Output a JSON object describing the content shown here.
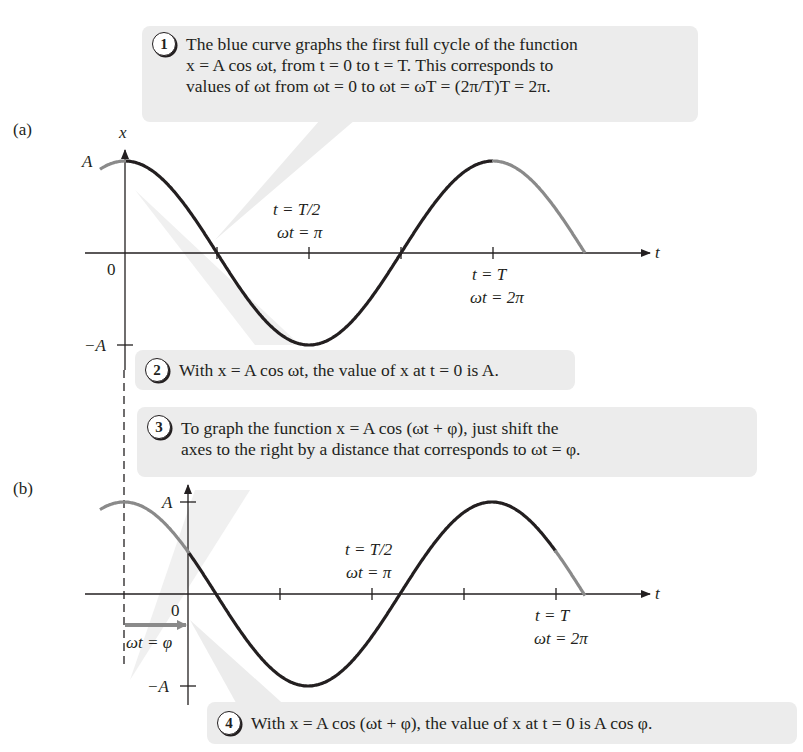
{
  "figure": {
    "panel_a_label": "(a)",
    "panel_b_label": "(b)",
    "axis_x_label": "x",
    "axis_t_label": "t",
    "zero_label": "0",
    "amp_pos_label": "A",
    "amp_neg_label": "−A",
    "half_period_line1": "t = T/2",
    "half_period_line2": "ωt = π",
    "period_line1": "t = T",
    "period_line2": "ωt = 2π",
    "phase_label": "ωt = φ"
  },
  "callouts": [
    {
      "number": "1",
      "lines": [
        "The blue curve graphs the first full cycle of the function",
        "x = A cos ωt, from t = 0 to t = T. This corresponds to",
        "values of ωt from ωt = 0 to ωt = ωT = (2π/T)T = 2π."
      ]
    },
    {
      "number": "2",
      "lines": [
        "With x = A cos ωt, the value of x at t = 0 is A."
      ]
    },
    {
      "number": "3",
      "lines": [
        "To graph the function x = A cos (ωt + φ), just shift the",
        "axes to the right by a distance that corresponds to ωt = φ."
      ]
    },
    {
      "number": "4",
      "lines": [
        "With x = A cos (ωt + φ), the value of x at t = 0 is A cos φ."
      ]
    }
  ],
  "colors": {
    "curve_main": "#231f20",
    "curve_extension": "#8a8a8a",
    "callout_bg": "#ececec",
    "phase_arrow": "#8a8a8a"
  },
  "chart_data": [
    {
      "type": "line",
      "title": "(a) x = A cos ωt",
      "xlabel": "t",
      "ylabel": "x",
      "x_ticks": [
        "T/4",
        "T/2",
        "3T/4",
        "T"
      ],
      "y_ticks": [
        "A",
        "0",
        "−A"
      ],
      "series": [
        {
          "name": "x = A cos ωt",
          "x_phase": [
            0,
            0.5,
            1,
            1.5,
            2
          ],
          "values": [
            1,
            0,
            -1,
            0,
            1
          ]
        }
      ],
      "grid": false
    },
    {
      "type": "line",
      "title": "(b) x = A cos (ωt + φ)",
      "xlabel": "t",
      "ylabel": "x",
      "y_ticks": [
        "A",
        "0",
        "−A"
      ],
      "series": [
        {
          "name": "x = A cos (ωt + φ)",
          "phi_fraction_of_period": 0.17,
          "values_at_t0": "A cos φ"
        }
      ],
      "grid": false
    }
  ]
}
